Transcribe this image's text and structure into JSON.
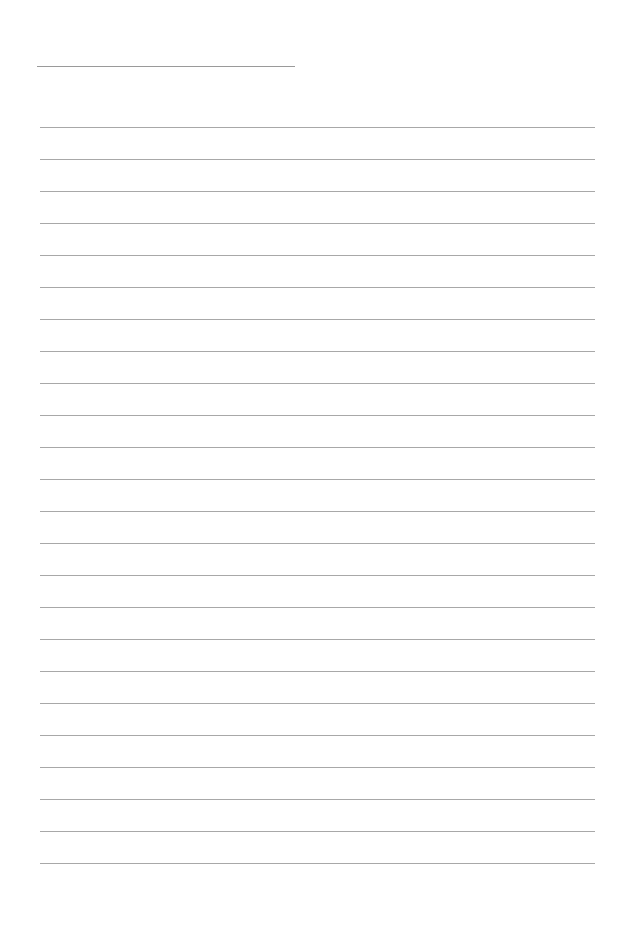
{
  "page": {
    "type": "lined-paper",
    "title_line": {
      "x": 37,
      "y": 66,
      "width": 258
    },
    "lines": {
      "count": 24,
      "start_y": 127,
      "spacing": 32,
      "x": 40,
      "width": 555
    },
    "line_color": "#a8a8a8",
    "background": "#ffffff"
  }
}
